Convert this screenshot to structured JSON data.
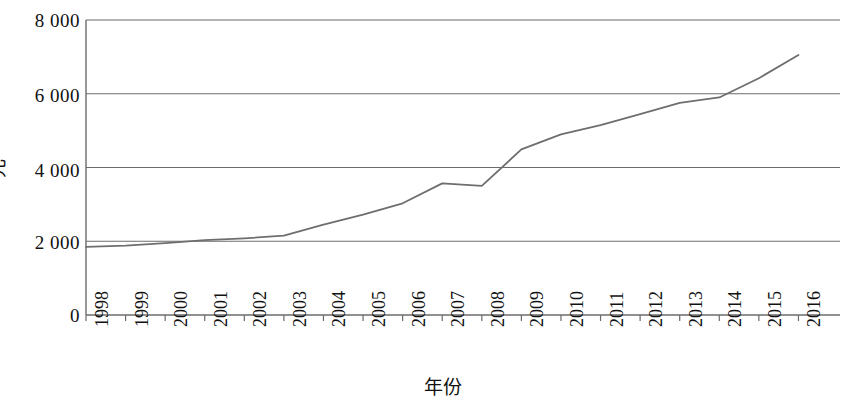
{
  "chart_data": {
    "type": "line",
    "title": "",
    "xlabel": "年份",
    "ylabel": "元",
    "categories": [
      "1998",
      "1999",
      "2000",
      "2001",
      "2002",
      "2003",
      "2004",
      "2005",
      "2006",
      "2007",
      "2008",
      "2009",
      "2010",
      "2011",
      "2012",
      "2013",
      "2014",
      "2015",
      "2016"
    ],
    "values": [
      1850,
      1880,
      1950,
      2030,
      2080,
      2150,
      2450,
      2720,
      3030,
      3570,
      3500,
      4490,
      4900,
      5150,
      5450,
      5750,
      5900,
      6420,
      7050
    ],
    "series": [
      {
        "name": "元",
        "values": [
          1850,
          1880,
          1950,
          2030,
          2080,
          2150,
          2450,
          2720,
          3030,
          3570,
          3500,
          4490,
          4900,
          5150,
          5450,
          5750,
          5900,
          6420,
          7050
        ]
      }
    ],
    "ylim": [
      0,
      8000
    ],
    "y_ticks": [
      "0",
      "2 000",
      "4 000",
      "6 000",
      "8 000"
    ],
    "y_tick_values": [
      0,
      2000,
      4000,
      6000,
      8000
    ],
    "grid": "horizontal",
    "legend": "none",
    "line_color": "#6e6e6e"
  },
  "axes": {
    "y_title": "元",
    "x_title": "年份",
    "y_tick_labels": [
      "8 000",
      "6 000",
      "4 000",
      "2 000",
      "0"
    ],
    "x_tick_labels": [
      "1998",
      "1999",
      "2000",
      "2001",
      "2002",
      "2003",
      "2004",
      "2005",
      "2006",
      "2007",
      "2008",
      "2009",
      "2010",
      "2011",
      "2012",
      "2013",
      "2014",
      "2015",
      "2016"
    ]
  }
}
